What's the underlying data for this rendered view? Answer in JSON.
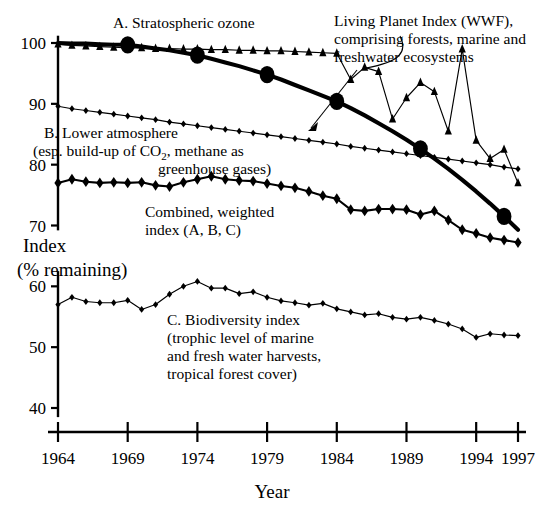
{
  "chart_data": {
    "type": "line",
    "title": "",
    "xlabel": "Year",
    "ylabel_line1": "Index",
    "ylabel_line2": "(% remaining)",
    "xlim": [
      1964,
      1997
    ],
    "ylim": [
      36,
      101.5
    ],
    "grid": false,
    "legend_position": "inline-annotations",
    "x_tick_labels": [
      "1964",
      "1969",
      "1974",
      "1979",
      "1984",
      "1989",
      "1994",
      "1997"
    ],
    "x_tick_values": [
      1964,
      1969,
      1974,
      1979,
      1984,
      1989,
      1994,
      1997
    ],
    "y_tick_labels": [
      "100",
      "90",
      "80",
      "70",
      "60",
      "50",
      "40"
    ],
    "y_tick_values": [
      100,
      90,
      80,
      70,
      60,
      50,
      40
    ],
    "x": [
      1964,
      1965,
      1966,
      1967,
      1968,
      1969,
      1970,
      1971,
      1972,
      1973,
      1974,
      1975,
      1976,
      1977,
      1978,
      1979,
      1980,
      1981,
      1982,
      1983,
      1984,
      1985,
      1986,
      1987,
      1988,
      1989,
      1990,
      1991,
      1992,
      1993,
      1994,
      1995,
      1996,
      1997
    ],
    "series": [
      {
        "name": "A. Stratospheric ozone",
        "marker": "triangle",
        "line_weight": "thin",
        "values": [
          99.8,
          99.6,
          99.5,
          99.4,
          99.3,
          99.2,
          99.2,
          99.1,
          99.1,
          99.0,
          99.0,
          98.9,
          98.9,
          98.8,
          98.8,
          98.7,
          98.7,
          98.6,
          98.5,
          98.4,
          98.3,
          94.0,
          96.0,
          95.3,
          87.5,
          91.0,
          93.5,
          92.0,
          85.5,
          99.0,
          84.0,
          81.0,
          82.5,
          77.0
        ]
      },
      {
        "name": "B. Lower atmosphere",
        "marker": "diamond-small",
        "line_weight": "thin",
        "values": [
          89.6,
          89.2,
          88.9,
          88.6,
          88.3,
          88.0,
          87.7,
          87.4,
          87.0,
          86.7,
          86.4,
          86.1,
          85.8,
          85.5,
          85.2,
          84.9,
          84.6,
          84.3,
          84.0,
          83.7,
          83.4,
          83.0,
          82.7,
          82.4,
          82.1,
          81.8,
          81.5,
          81.2,
          80.9,
          80.6,
          80.3,
          80.0,
          79.6,
          79.3
        ]
      },
      {
        "name": "Combined, weighted index (A, B, C)",
        "marker": "diamond-large",
        "line_weight": "medium",
        "values": [
          77.0,
          77.6,
          77.2,
          77.0,
          77.1,
          77.0,
          77.1,
          76.6,
          76.4,
          77.1,
          77.6,
          78.1,
          77.6,
          77.4,
          77.3,
          76.9,
          76.5,
          76.2,
          75.6,
          74.9,
          74.4,
          72.6,
          72.4,
          72.7,
          72.7,
          72.6,
          71.8,
          72.4,
          70.9,
          69.3,
          68.7,
          68.0,
          67.6,
          67.2
        ]
      },
      {
        "name": "C. Biodiversity index",
        "marker": "diamond-small",
        "line_weight": "thin",
        "values": [
          57.0,
          58.2,
          57.5,
          57.3,
          57.3,
          57.7,
          56.2,
          57.0,
          58.7,
          60.0,
          60.8,
          59.7,
          59.7,
          58.8,
          59.1,
          58.2,
          57.6,
          57.3,
          56.9,
          57.2,
          56.3,
          55.8,
          55.3,
          55.5,
          54.9,
          54.6,
          54.9,
          54.4,
          53.8,
          53.0,
          51.6,
          52.2,
          52.0,
          51.9
        ]
      },
      {
        "name": "Living Planet Index (WWF)",
        "marker": "dot-large",
        "line_weight": "thick",
        "values": [
          100.0,
          99.9,
          99.9,
          99.8,
          99.7,
          99.7,
          99.4,
          99.1,
          98.8,
          98.4,
          98.0,
          97.4,
          96.8,
          96.2,
          95.5,
          94.8,
          94.0,
          93.1,
          92.2,
          91.3,
          90.4,
          89.3,
          88.1,
          86.8,
          85.5,
          84.1,
          82.6,
          81.0,
          79.3,
          77.5,
          75.6,
          73.6,
          71.5,
          69.3
        ],
        "big_dot_years": [
          1969,
          1974,
          1979,
          1984,
          1990,
          1996
        ]
      }
    ],
    "annotations": [
      {
        "id": "annot-ozone",
        "text": "A. Stratospheric ozone",
        "x_px": 113,
        "y_px": 28
      },
      {
        "id": "annot-lower-atmosphere",
        "line1": "B. Lower atmosphere",
        "line2_a": "(esp. build-up of CO",
        "line2_sub": "2",
        "line2_b": ", methane as",
        "line3": "greenhouse gases)",
        "x_px": 44,
        "y_px": 138
      },
      {
        "id": "annot-combined",
        "line1": "Combined, weighted",
        "line2": "index (A, B, C)",
        "x_px": 145,
        "y_px": 215
      },
      {
        "id": "annot-biodiversity",
        "line1": "C. Biodiversity index",
        "line2": "(trophic level of marine",
        "line3": "and fresh water harvests,",
        "line4": "tropical forest cover)",
        "x_px": 167,
        "y_px": 323
      },
      {
        "id": "annot-lpi",
        "line1": "Living Planet Index (WWF),",
        "line2": "comprising forests, marine and",
        "line3": "freshwater ecosystems",
        "x_px": 334,
        "y_px": 26
      }
    ]
  }
}
